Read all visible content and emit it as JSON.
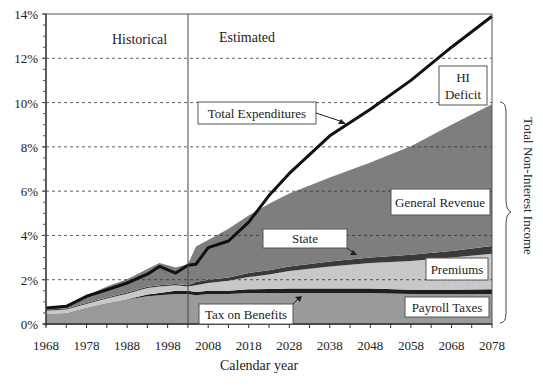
{
  "chart_data": {
    "type": "area",
    "title": "",
    "xlabel": "Calendar year",
    "ylabel": "",
    "right_label": "Total Non-Interest Income",
    "xlim": [
      1968,
      2078
    ],
    "ylim": [
      0,
      14
    ],
    "x_ticks": [
      "1968",
      "1978",
      "1988",
      "1998",
      "2008",
      "2018",
      "2028",
      "2038",
      "2048",
      "2058",
      "2068",
      "2078"
    ],
    "y_ticks": [
      "0%",
      "2%",
      "4%",
      "6%",
      "8%",
      "10%",
      "12%",
      "14%"
    ],
    "grid": "horizontal dashed",
    "period_labels": {
      "historical": "Historical",
      "estimated": "Estimated",
      "divider_year": 2003
    },
    "x": [
      1968,
      1973,
      1978,
      1983,
      1988,
      1993,
      1996,
      2000,
      2003,
      2005,
      2008,
      2013,
      2018,
      2023,
      2028,
      2038,
      2048,
      2058,
      2068,
      2078
    ],
    "series": [
      {
        "name": "Payroll Taxes",
        "color": "#9a9a9a",
        "values": [
          0.45,
          0.5,
          0.75,
          0.95,
          1.1,
          1.25,
          1.3,
          1.35,
          1.35,
          1.3,
          1.35,
          1.35,
          1.4,
          1.4,
          1.4,
          1.4,
          1.4,
          1.35,
          1.35,
          1.35
        ]
      },
      {
        "name": "Tax on Benefits",
        "color": "#1e1e1e",
        "values": [
          0.0,
          0.0,
          0.0,
          0.0,
          0.02,
          0.08,
          0.1,
          0.15,
          0.15,
          0.15,
          0.15,
          0.15,
          0.17,
          0.18,
          0.2,
          0.2,
          0.2,
          0.2,
          0.2,
          0.22
        ]
      },
      {
        "name": "Premiums",
        "color": "#c8c8c8",
        "values": [
          0.15,
          0.15,
          0.15,
          0.2,
          0.25,
          0.3,
          0.3,
          0.25,
          0.2,
          0.3,
          0.35,
          0.45,
          0.55,
          0.65,
          0.8,
          1.0,
          1.15,
          1.3,
          1.45,
          1.6
        ]
      },
      {
        "name": "State",
        "color": "#3a3a3a",
        "values": [
          0.05,
          0.05,
          0.05,
          0.05,
          0.05,
          0.05,
          0.05,
          0.05,
          0.05,
          0.15,
          0.15,
          0.15,
          0.18,
          0.2,
          0.2,
          0.22,
          0.25,
          0.28,
          0.3,
          0.35
        ]
      },
      {
        "name": "General Revenue",
        "color": "#7e7e7e",
        "values": [
          0.1,
          0.15,
          0.3,
          0.5,
          0.6,
          0.8,
          1.0,
          0.75,
          0.95,
          1.6,
          1.8,
          2.2,
          2.6,
          3.0,
          3.3,
          3.8,
          4.3,
          4.9,
          5.7,
          6.4
        ]
      }
    ],
    "total_expenditures": {
      "name": "Total Expenditures",
      "color": "#111111",
      "values": [
        0.72,
        0.8,
        1.25,
        1.55,
        1.85,
        2.25,
        2.6,
        2.3,
        2.65,
        2.7,
        3.45,
        3.75,
        4.6,
        5.8,
        6.8,
        8.5,
        9.7,
        11.0,
        12.5,
        13.9
      ]
    },
    "annotations": [
      {
        "text": "HI Deficit",
        "lines": [
          "HI",
          "Deficit"
        ]
      },
      {
        "text": "Total Expenditures"
      },
      {
        "text": "General Revenue"
      },
      {
        "text": "State"
      },
      {
        "text": "Premiums"
      },
      {
        "text": "Tax on Benefits"
      },
      {
        "text": "Payroll Taxes"
      }
    ]
  }
}
